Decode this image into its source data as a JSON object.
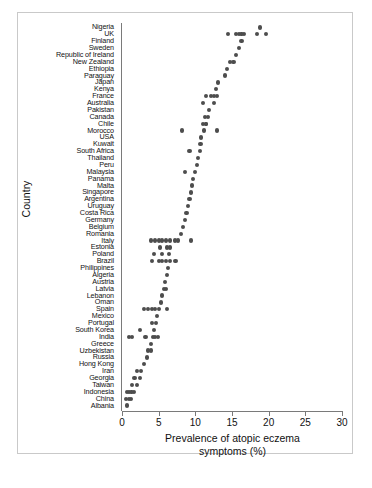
{
  "chart": {
    "y_axis_title": "Country",
    "x_axis_title_line1": "Prevalence of atopic eczema",
    "x_axis_title_line2": "symptoms (%)",
    "point_color": "#4d4d4d",
    "axis_color": "#7a7a7a",
    "frame_color": "#c9c9c9"
  },
  "chart_data": {
    "type": "scatter",
    "title": "",
    "xlabel": "Prevalence of atopic eczema symptoms (%)",
    "ylabel": "Country",
    "xlim": [
      0,
      30
    ],
    "xticks": [
      0,
      5,
      10,
      15,
      20,
      25,
      30
    ],
    "xtick_labels": [
      "0",
      "5",
      "10",
      "15",
      "20",
      "25",
      "30"
    ],
    "grid": false,
    "legend": "none",
    "orientation": "horizontal-strip",
    "note": "Each dot is one study centre; countries ordered by prevalence (highest at top).",
    "categories": [
      "Nigeria",
      "UK",
      "Finland",
      "Sweden",
      "Republic of Ireland",
      "New Zealand",
      "Ethiopia",
      "Paraguay",
      "Japan",
      "Kenya",
      "France",
      "Australia",
      "Pakistan",
      "Canada",
      "Chile",
      "Morocco",
      "USA",
      "Kuwait",
      "South Africa",
      "Thailand",
      "Peru",
      "Malaysia",
      "Panama",
      "Malta",
      "Singapore",
      "Argentina",
      "Uruguay",
      "Costa Rica",
      "Germany",
      "Belgium",
      "Romania",
      "Italy",
      "Estonia",
      "Poland",
      "Brazil",
      "Philippines",
      "Algeria",
      "Austria",
      "Latvia",
      "Lebanon",
      "Oman",
      "Spain",
      "Mexico",
      "Portugal",
      "South Korea",
      "India",
      "Greece",
      "Uzbekistan",
      "Russia",
      "Hong Kong",
      "Iran",
      "Georgia",
      "Taiwan",
      "Indonesia",
      "China",
      "Albania"
    ],
    "values_by_country": [
      [
        18.8
      ],
      [
        14.5,
        15.5,
        16.0,
        16.3,
        16.6,
        18.4,
        19.6
      ],
      [
        16.3
      ],
      [
        15.9
      ],
      [
        15.5
      ],
      [
        14.7,
        15.2
      ],
      [
        14.3
      ],
      [
        14.0
      ],
      [
        13.1
      ],
      [
        12.8
      ],
      [
        11.4,
        12.1,
        12.6,
        13.0
      ],
      [
        11.1,
        12.6
      ],
      [
        11.9
      ],
      [
        11.3,
        11.7
      ],
      [
        11.0,
        11.4,
        11.5
      ],
      [
        8.2,
        11.2,
        12.9
      ],
      [
        10.8
      ],
      [
        10.7
      ],
      [
        9.2,
        10.6
      ],
      [
        10.4
      ],
      [
        10.2
      ],
      [
        8.6,
        9.9
      ],
      [
        9.7
      ],
      [
        9.6
      ],
      [
        9.4
      ],
      [
        9.2
      ],
      [
        9.0
      ],
      [
        8.8
      ],
      [
        8.6
      ],
      [
        8.3
      ],
      [
        8.1
      ],
      [
        4.0,
        4.5,
        5.0,
        5.5,
        6.0,
        6.5,
        7.2,
        7.6,
        9.4
      ],
      [
        5.2,
        6.1,
        6.5
      ],
      [
        4.4,
        5.5,
        6.4
      ],
      [
        4.1,
        5.1,
        5.4,
        6.0,
        6.5,
        7.3
      ],
      [
        6.3
      ],
      [
        6.1
      ],
      [
        5.9
      ],
      [
        5.7,
        6.0
      ],
      [
        5.5
      ],
      [
        5.3
      ],
      [
        3.0,
        3.6,
        4.1,
        4.5,
        5.0,
        6.1
      ],
      [
        4.8
      ],
      [
        4.1,
        4.6
      ],
      [
        2.5,
        4.4
      ],
      [
        1.0,
        1.4,
        3.2,
        4.2,
        4.5,
        4.9
      ],
      [
        4.0
      ],
      [
        3.6,
        3.9
      ],
      [
        3.4
      ],
      [
        3.0
      ],
      [
        2.1,
        2.6
      ],
      [
        1.7,
        2.4
      ],
      [
        1.4,
        2.0
      ],
      [
        0.7,
        1.0,
        1.3,
        1.6
      ],
      [
        0.6,
        0.9,
        1.2
      ],
      [
        0.7
      ]
    ]
  }
}
